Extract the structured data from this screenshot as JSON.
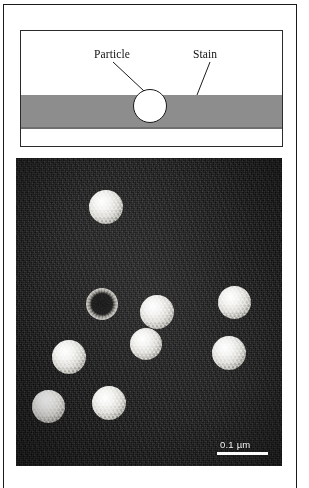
{
  "figure": {
    "schematic": {
      "labels": {
        "particle": "Particle",
        "stain": "Stain"
      },
      "colors": {
        "stain_fill": "#8d8d8d",
        "particle_fill": "#ffffff",
        "outline": "#1a1a1a"
      }
    },
    "micrograph": {
      "scale_bar": {
        "label": "0.1 µm",
        "length_px": 51
      },
      "colors": {
        "background": "#151515",
        "particle_highlight": "#ffffff",
        "scale_bar": "#fbfbfb"
      },
      "particles": [
        {
          "name": "particle-top-center",
          "x": 73,
          "y": 32,
          "d": 34,
          "type": "solid"
        },
        {
          "name": "particle-mid-left-ring",
          "x": 70,
          "y": 130,
          "d": 32,
          "type": "ring"
        },
        {
          "name": "particle-mid-center",
          "x": 124,
          "y": 137,
          "d": 34,
          "type": "solid"
        },
        {
          "name": "particle-mid-right",
          "x": 202,
          "y": 128,
          "d": 33,
          "type": "solid"
        },
        {
          "name": "particle-lower-center",
          "x": 114,
          "y": 170,
          "d": 32,
          "type": "solid"
        },
        {
          "name": "particle-lower-right",
          "x": 196,
          "y": 178,
          "d": 34,
          "type": "solid"
        },
        {
          "name": "particle-left-upper",
          "x": 36,
          "y": 182,
          "d": 34,
          "type": "solid"
        },
        {
          "name": "particle-left-lower",
          "x": 16,
          "y": 232,
          "d": 33,
          "type": "solid"
        },
        {
          "name": "particle-bottom-center",
          "x": 76,
          "y": 228,
          "d": 34,
          "type": "solid"
        }
      ]
    }
  }
}
